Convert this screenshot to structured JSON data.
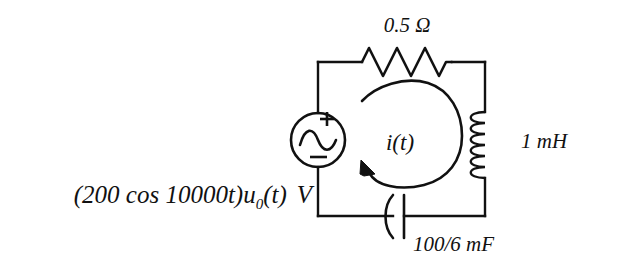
{
  "figure": {
    "background_color": "#ffffff",
    "ink_color": "#111111",
    "width": 617,
    "height": 264
  },
  "labels": {
    "resistor": "0.5 Ω",
    "resistor_value": "0.5",
    "resistor_unit": "Ω",
    "inductor": "1 mH",
    "inductor_value": "1",
    "inductor_unit": "mH",
    "capacitor": "100/6 mF",
    "capacitor_value": "100/6",
    "capacitor_unit": "mF",
    "current": "i(t)",
    "source_expression_main": "(200 cos 10000t)u",
    "source_expression_subscript": "0",
    "source_expression_tail": "(t)",
    "source_unit": "V",
    "source_full": "(200 cos 10000t)u0(t) V",
    "source_polarity_plus": "+",
    "source_polarity_minus": "−"
  },
  "components": {
    "source": {
      "name": "ac-voltage-source",
      "symbol": "circle-with-sine-wave",
      "cx": 318,
      "cy": 140,
      "r": 27
    },
    "resistor": {
      "name": "resistor",
      "symbol": "zigzag",
      "peaks": 6,
      "x_start": 362,
      "x_end": 452,
      "y": 62
    },
    "inductor": {
      "name": "inductor",
      "symbol": "coil",
      "loops": 6,
      "x": 485,
      "y_start": 112,
      "y_end": 178
    },
    "capacitor": {
      "name": "capacitor",
      "symbol": "curved-plate-capacitor",
      "x": 400,
      "y": 216,
      "plate_height": 42
    }
  },
  "circuit_box": {
    "left": 318,
    "right": 485,
    "top": 62,
    "bottom": 216
  }
}
